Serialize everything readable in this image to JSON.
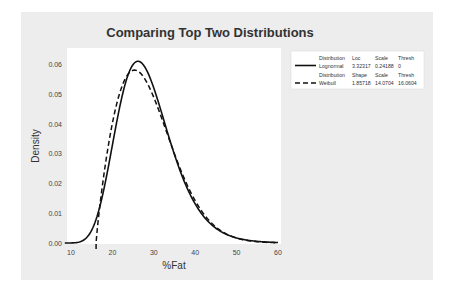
{
  "chart_data": {
    "type": "line",
    "title": "Comparing Top Two Distributions",
    "xlabel": "%Fat",
    "ylabel": "Density",
    "xlim": [
      10,
      60
    ],
    "ylim": [
      0.0,
      0.062
    ],
    "x_ticks": [
      "10",
      "20",
      "30",
      "40",
      "50",
      "60"
    ],
    "y_ticks": [
      "0.00",
      "0.01",
      "0.02",
      "0.03",
      "0.04",
      "0.05",
      "0.06"
    ],
    "grid": false,
    "legend_position": "right-top",
    "series": [
      {
        "name": "Lognormal",
        "line_style": "solid",
        "distribution": "Lognormal",
        "params": {
          "Loc": "3.32317",
          "Scale": "0.24188",
          "Thresh": "0"
        },
        "approx_points": [
          [
            10,
            0.0001
          ],
          [
            15,
            0.005
          ],
          [
            20,
            0.035
          ],
          [
            25,
            0.058
          ],
          [
            27.5,
            0.061
          ],
          [
            30,
            0.056
          ],
          [
            35,
            0.036
          ],
          [
            40,
            0.018
          ],
          [
            45,
            0.008
          ],
          [
            50,
            0.003
          ],
          [
            55,
            0.001
          ],
          [
            60,
            0.0004
          ]
        ]
      },
      {
        "name": "Weibull",
        "line_style": "dashed",
        "distribution": "Weibull",
        "params": {
          "Shape": "1.85718",
          "Scale": "14.0704",
          "Thresh": "16.0604"
        },
        "approx_points": [
          [
            16.06,
            0.0
          ],
          [
            20,
            0.033
          ],
          [
            25,
            0.057
          ],
          [
            26.5,
            0.059
          ],
          [
            30,
            0.054
          ],
          [
            35,
            0.035
          ],
          [
            40,
            0.017
          ],
          [
            45,
            0.006
          ],
          [
            50,
            0.002
          ],
          [
            55,
            0.0005
          ],
          [
            60,
            0.0001
          ]
        ]
      }
    ]
  },
  "legend": {
    "row1_header": {
      "distribution": "Distribution",
      "c1": "Loc",
      "c2": "Scale",
      "c3": "Thresh"
    },
    "row1_values": {
      "name": "Lognormal",
      "c1": "3.32317",
      "c2": "0.24188",
      "c3": "0"
    },
    "row2_header": {
      "distribution": "Distribution",
      "c1": "Shape",
      "c2": "Scale",
      "c3": "Thresh"
    },
    "row2_values": {
      "name": "Weibull",
      "c1": "1.85718",
      "c2": "14.0704",
      "c3": "16.0604"
    }
  },
  "colors": {
    "panel_bg": "#ededed",
    "plot_bg": "#ffffff",
    "line": "#111111"
  }
}
